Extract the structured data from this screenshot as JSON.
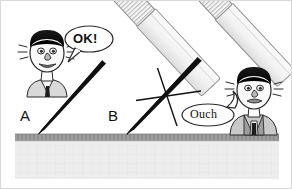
{
  "figure": {
    "background_color": "#ffffff",
    "width": 292,
    "height": 189
  },
  "labels": {
    "a": "A",
    "b": "B"
  },
  "speech": {
    "ok": "OK!",
    "ouch": "Ouch"
  },
  "colors": {
    "needle": "#101010",
    "skin_surface": "#9a9a9a",
    "tissue_fill": "#ececec",
    "syringe_body": "#f4f4f4",
    "syringe_outline": "#8c8c8c",
    "hair": "#101010",
    "face_fill": "#fbfbfb",
    "shirt": "#d6d6d6",
    "vest": "#a8a8a8",
    "outline": "#2a2a2a",
    "frame": "#d8d8d8"
  },
  "scene": {
    "left_character": {
      "name": "happy-patient",
      "expression": "calm",
      "says": "OK!"
    },
    "right_character": {
      "name": "hurt-patient",
      "expression": "pained",
      "says": "Ouch"
    },
    "needle_a": {
      "label": "A",
      "condition": "smooth-tip",
      "outcome": "painless"
    },
    "needle_b": {
      "label": "B",
      "condition": "burred-tip",
      "outcome": "painful"
    },
    "surface": {
      "name": "skin-surface",
      "description": "skin surface line with tissue below"
    }
  }
}
